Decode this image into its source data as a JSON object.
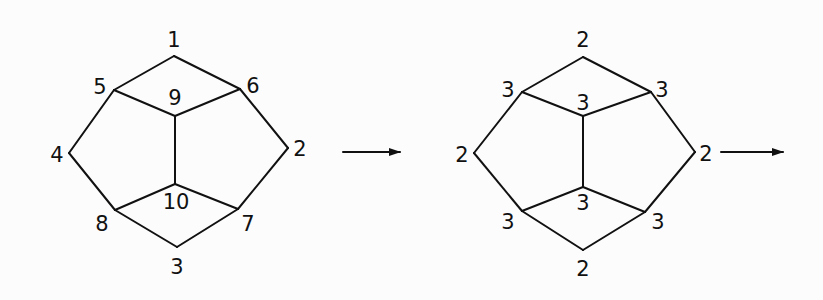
{
  "diagram": {
    "type": "graph-transformation",
    "graphs": [
      {
        "id": "left-graph",
        "vertices": [
          {
            "id": "1",
            "label": "1",
            "x": 174,
            "y": 56,
            "lx": 174,
            "ly": 47
          },
          {
            "id": "2",
            "label": "2",
            "x": 288,
            "y": 148,
            "lx": 300,
            "ly": 156
          },
          {
            "id": "3",
            "label": "3",
            "x": 177,
            "y": 247,
            "lx": 177,
            "ly": 274
          },
          {
            "id": "4",
            "label": "4",
            "x": 69,
            "y": 153,
            "lx": 57,
            "ly": 162
          },
          {
            "id": "5",
            "label": "5",
            "x": 114,
            "y": 90,
            "lx": 100,
            "ly": 94
          },
          {
            "id": "6",
            "label": "6",
            "x": 240,
            "y": 89,
            "lx": 253,
            "ly": 93
          },
          {
            "id": "7",
            "label": "7",
            "x": 238,
            "y": 209,
            "lx": 248,
            "ly": 231
          },
          {
            "id": "8",
            "label": "8",
            "x": 115,
            "y": 210,
            "lx": 102,
            "ly": 231
          },
          {
            "id": "9",
            "label": "9",
            "x": 175,
            "y": 116,
            "lx": 175,
            "ly": 105
          },
          {
            "id": "10",
            "label": "10",
            "x": 175,
            "y": 184,
            "lx": 176,
            "ly": 209
          }
        ],
        "edges": [
          [
            "1",
            "5"
          ],
          [
            "1",
            "6"
          ],
          [
            "5",
            "9"
          ],
          [
            "6",
            "9"
          ],
          [
            "5",
            "4"
          ],
          [
            "6",
            "2"
          ],
          [
            "9",
            "10"
          ],
          [
            "4",
            "8"
          ],
          [
            "2",
            "7"
          ],
          [
            "10",
            "8"
          ],
          [
            "10",
            "7"
          ],
          [
            "8",
            "3"
          ],
          [
            "7",
            "3"
          ]
        ]
      },
      {
        "id": "right-graph",
        "vertices": [
          {
            "id": "a",
            "label": "2",
            "x": 583,
            "y": 57,
            "lx": 583,
            "ly": 47
          },
          {
            "id": "b",
            "label": "3",
            "x": 522,
            "y": 92,
            "lx": 508,
            "ly": 97
          },
          {
            "id": "c",
            "label": "3",
            "x": 651,
            "y": 92,
            "lx": 662,
            "ly": 97
          },
          {
            "id": "d",
            "label": "3",
            "x": 583,
            "y": 116,
            "lx": 583,
            "ly": 110
          },
          {
            "id": "e",
            "label": "2",
            "x": 474,
            "y": 153,
            "lx": 462,
            "ly": 162
          },
          {
            "id": "f",
            "label": "2",
            "x": 695,
            "y": 152,
            "lx": 706,
            "ly": 161
          },
          {
            "id": "g",
            "label": "3",
            "x": 583,
            "y": 187,
            "lx": 583,
            "ly": 210
          },
          {
            "id": "h",
            "label": "3",
            "x": 522,
            "y": 211,
            "lx": 508,
            "ly": 229
          },
          {
            "id": "i",
            "label": "3",
            "x": 645,
            "y": 212,
            "lx": 658,
            "ly": 229
          },
          {
            "id": "j",
            "label": "2",
            "x": 583,
            "y": 250,
            "lx": 583,
            "ly": 276
          }
        ],
        "edges": [
          [
            "a",
            "b"
          ],
          [
            "a",
            "c"
          ],
          [
            "b",
            "d"
          ],
          [
            "c",
            "d"
          ],
          [
            "b",
            "e"
          ],
          [
            "c",
            "f"
          ],
          [
            "d",
            "g"
          ],
          [
            "e",
            "h"
          ],
          [
            "f",
            "i"
          ],
          [
            "g",
            "h"
          ],
          [
            "g",
            "i"
          ],
          [
            "h",
            "j"
          ],
          [
            "i",
            "j"
          ]
        ]
      }
    ],
    "arrows": [
      {
        "id": "arrow-1",
        "x1": 343,
        "y1": 152,
        "x2": 400,
        "y2": 152
      },
      {
        "id": "arrow-2",
        "x1": 721,
        "y1": 152,
        "x2": 783,
        "y2": 152
      }
    ]
  }
}
